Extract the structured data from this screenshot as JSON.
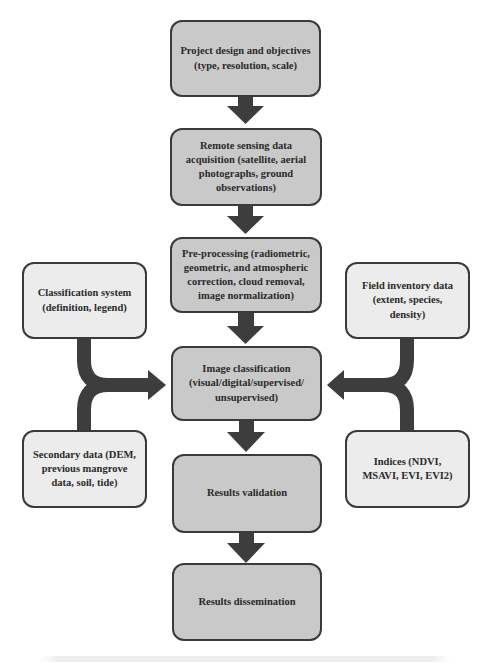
{
  "diagram": {
    "type": "flowchart",
    "colors": {
      "main_fill": "#c9c9c9",
      "side_fill": "#ececec",
      "border": "#3a3a3a",
      "arrow": "#3d3d3d",
      "text": "#2a2a2a"
    },
    "main_steps": [
      {
        "id": "project-design",
        "label": "Project design and objectives (type, resolution, scale)"
      },
      {
        "id": "data-acquisition",
        "label": "Remote sensing data acquisition (satellite, aerial photographs, ground observations)"
      },
      {
        "id": "pre-processing",
        "label": "Pre-processing (radiometric, geometric, and atmospheric correction, cloud removal, image normalization)"
      },
      {
        "id": "image-classification",
        "label": "Image classification (visual/digital/supervised/ unsupervised)"
      },
      {
        "id": "results-validation",
        "label": "Results validation"
      },
      {
        "id": "results-dissemination",
        "label": "Results dissemination"
      }
    ],
    "left_inputs": [
      {
        "id": "classification-system",
        "label": "Classification system (definition, legend)"
      },
      {
        "id": "secondary-data",
        "label": "Secondary data (DEM, previous mangrove data, soil, tide)"
      }
    ],
    "right_inputs": [
      {
        "id": "field-inventory",
        "label": "Field inventory data (extent, species, density)"
      },
      {
        "id": "indices",
        "label": "Indices (NDVI, MSAVI, EVI, EVI2)"
      }
    ],
    "edges": [
      {
        "from": "project-design",
        "to": "data-acquisition"
      },
      {
        "from": "data-acquisition",
        "to": "pre-processing"
      },
      {
        "from": "pre-processing",
        "to": "image-classification"
      },
      {
        "from": "classification-system",
        "to": "image-classification"
      },
      {
        "from": "secondary-data",
        "to": "image-classification"
      },
      {
        "from": "field-inventory",
        "to": "image-classification"
      },
      {
        "from": "indices",
        "to": "image-classification"
      },
      {
        "from": "image-classification",
        "to": "results-validation"
      },
      {
        "from": "results-validation",
        "to": "results-dissemination"
      }
    ]
  }
}
